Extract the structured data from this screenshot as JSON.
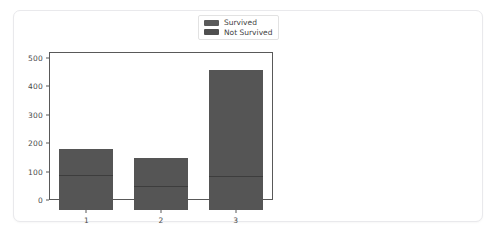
{
  "chart_data": {
    "type": "bar",
    "title": "",
    "xlabel": "",
    "ylabel": "",
    "categories": [
      "1",
      "2",
      "3"
    ],
    "xtick_labels": [
      "1",
      "2",
      "3"
    ],
    "ytick_labels": [
      "0",
      "100",
      "200",
      "300",
      "400",
      "500"
    ],
    "ytick_values": [
      0,
      100,
      200,
      300,
      400,
      500
    ],
    "ylim": [
      0,
      520
    ],
    "grid": false,
    "legend_position": "upper right",
    "bar_overlay_style": "overlaid",
    "series": [
      {
        "name": "Not Survived",
        "color": "#555555",
        "values": [
          216,
          184,
          491
        ]
      },
      {
        "name": "Survived",
        "color": "#555555",
        "values": [
          122,
          83,
          119
        ]
      }
    ]
  },
  "legend": {
    "entries": [
      {
        "label": "Survived",
        "color": "#5a5a5a"
      },
      {
        "label": "Not Survived",
        "color": "#4f4f4f"
      }
    ]
  },
  "axis": {
    "spine_color": "#595959",
    "tick_text_color": "#4a4a4a"
  },
  "card": {
    "background": "#ffffff",
    "border_color": "#e9e9ec"
  }
}
